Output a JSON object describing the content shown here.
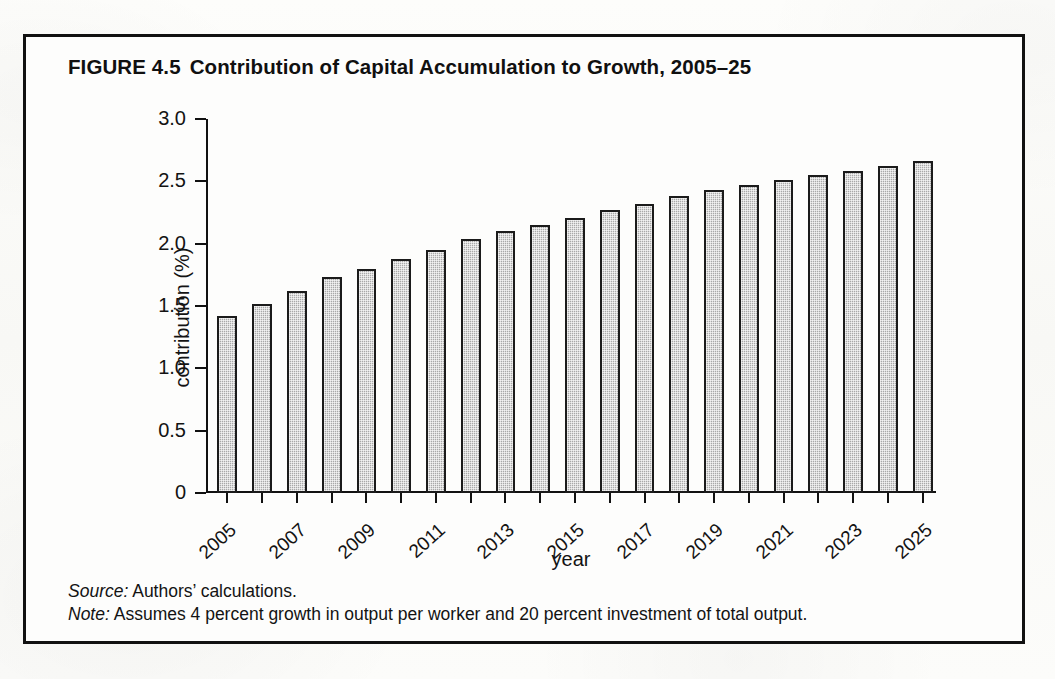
{
  "figure": {
    "number": "FIGURE 4.5",
    "title": "Contribution of Capital Accumulation to Growth, 2005–25"
  },
  "footnotes": {
    "source_label": "Source:",
    "source_text": "Authors’ calculations.",
    "note_label": "Note:",
    "note_text": "Assumes 4 percent growth in output per worker and 20 percent investment of total output."
  },
  "colors": {
    "frame": "#111111",
    "bar_fill": "#a9a9a9",
    "bar_border": "#1b1b1b",
    "text": "#131313",
    "page_background": "#fbfbf9"
  },
  "chart_data": {
    "type": "bar",
    "title": "Contribution of Capital Accumulation to Growth, 2005–25",
    "xlabel": "year",
    "ylabel": "contribution (%)",
    "ylim": [
      0,
      3.0
    ],
    "ytick_values": [
      0,
      0.5,
      1.0,
      1.5,
      2.0,
      2.5,
      3.0
    ],
    "ytick_labels": [
      "0",
      "0.5",
      "1.0",
      "1.5",
      "2.0",
      "2.5",
      "3.0"
    ],
    "grid": false,
    "legend": "none",
    "categories": [
      "2005",
      "2006",
      "2007",
      "2008",
      "2009",
      "2010",
      "2011",
      "2012",
      "2013",
      "2014",
      "2015",
      "2016",
      "2017",
      "2018",
      "2019",
      "2020",
      "2021",
      "2022",
      "2023",
      "2024",
      "2025"
    ],
    "xtick_labels_shown": [
      "2005",
      "2007",
      "2009",
      "2011",
      "2013",
      "2015",
      "2017",
      "2019",
      "2021",
      "2023",
      "2025"
    ],
    "values": [
      1.42,
      1.52,
      1.62,
      1.73,
      1.8,
      1.88,
      1.95,
      2.04,
      2.1,
      2.15,
      2.21,
      2.27,
      2.32,
      2.38,
      2.43,
      2.47,
      2.51,
      2.55,
      2.58,
      2.62,
      2.66
    ]
  }
}
